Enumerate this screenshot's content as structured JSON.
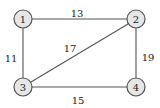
{
  "graph": {
    "colors": {
      "background": "#ffffff",
      "node_fill": "#e6e6e6",
      "node_stroke": "#555555",
      "edge_stroke": "#555555",
      "text": "#222222"
    },
    "nodes": [
      {
        "id": "1",
        "label": "1",
        "x": 23,
        "y": 19
      },
      {
        "id": "2",
        "label": "2",
        "x": 136,
        "y": 19
      },
      {
        "id": "3",
        "label": "3",
        "x": 23,
        "y": 87
      },
      {
        "id": "4",
        "label": "4",
        "x": 136,
        "y": 87
      }
    ],
    "edges": [
      {
        "from": "1",
        "to": "2",
        "weight": "13",
        "label_x": 77,
        "label_y": 13
      },
      {
        "from": "1",
        "to": "3",
        "weight": "11",
        "label_x": 11,
        "label_y": 58
      },
      {
        "from": "3",
        "to": "2",
        "weight": "17",
        "label_x": 70,
        "label_y": 48
      },
      {
        "from": "2",
        "to": "4",
        "weight": "19",
        "label_x": 148,
        "label_y": 57
      },
      {
        "from": "3",
        "to": "4",
        "weight": "15",
        "label_x": 78,
        "label_y": 100
      }
    ]
  }
}
